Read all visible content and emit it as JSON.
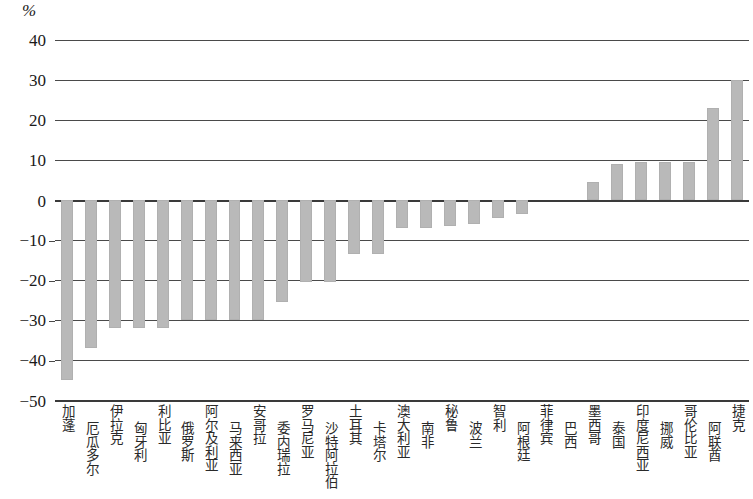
{
  "chart_data": {
    "type": "bar",
    "title": "",
    "subtitle": "",
    "xlabel": "",
    "ylabel": "%",
    "unit_label": "%",
    "ylim": [
      -50,
      40
    ],
    "ytick_values": [
      40,
      30,
      20,
      10,
      0,
      -10,
      -20,
      -30,
      -40,
      -50
    ],
    "ytick_labels": [
      "40",
      "30",
      "20",
      "10",
      "0",
      "−10",
      "−20",
      "−30",
      "−40",
      "−50"
    ],
    "grid": true,
    "legend": "none",
    "bar_color": "#b9b9b9",
    "categories": [
      "加蓬",
      "厄瓜多尔",
      "伊拉克",
      "匈牙利",
      "利比亚",
      "俄罗斯",
      "阿尔及利亚",
      "马来西亚",
      "安哥拉",
      "委内瑞拉",
      "罗马尼亚",
      "沙特阿拉伯",
      "土耳其",
      "卡塔尔",
      "澳大利亚",
      "南非",
      "秘鲁",
      "波兰",
      "智利",
      "阿根廷",
      "菲律宾",
      "巴西",
      "墨西哥",
      "泰国",
      "印度尼西亚",
      "挪威",
      "哥伦比亚",
      "阿联酋",
      "捷克"
    ],
    "values": [
      -45.0,
      -37.0,
      -32.0,
      -32.0,
      -32.0,
      -30.0,
      -30.0,
      -30.0,
      -30.0,
      -25.5,
      -20.5,
      -20.5,
      -13.5,
      -13.5,
      -7.0,
      -7.0,
      -6.5,
      -6.0,
      -4.5,
      -3.5,
      0.0,
      0.0,
      4.5,
      9.0,
      9.5,
      9.5,
      9.5,
      23.0,
      30.0
    ]
  }
}
